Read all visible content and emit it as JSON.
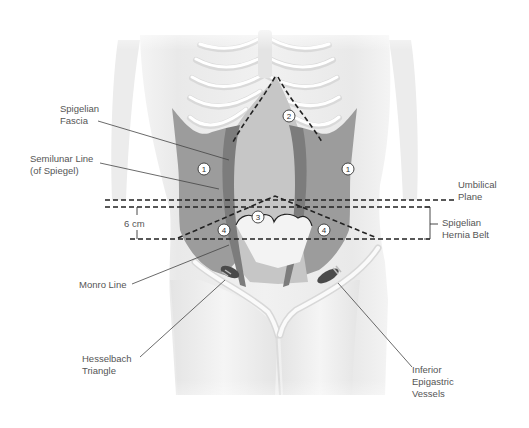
{
  "figure": {
    "labels": {
      "spigelian_fascia": [
        "Spigelian",
        "Fascia"
      ],
      "semilunar_line": [
        "Semilunar Line",
        "(of Spiegel)"
      ],
      "umbilical_plane": [
        "Umbilical",
        "Plane"
      ],
      "six_cm": "6 cm",
      "spigelian_hernia_belt": [
        "Spigelian",
        "Hernia Belt"
      ],
      "monro_line": "Monro Line",
      "hesselbach_triangle": [
        "Hesselbach",
        "Triangle"
      ],
      "inferior_epigastric_vessels": [
        "Inferior",
        "Epigastric",
        "Vessels"
      ]
    },
    "region_numbers": {
      "left_lateral": "1",
      "right_lateral": "1",
      "upper_rectus": "2",
      "umbilical": "3",
      "left_belt": "4",
      "right_belt": "4"
    },
    "colors": {
      "background": "#ffffff",
      "body": "#eeeeee",
      "body_shade": "#e2e2e2",
      "muscle": "#9a9a9a",
      "rectus": "#c4c4c4",
      "semilunar": "#7a7a7a",
      "dashed_line": "#222222",
      "text": "#555555"
    }
  }
}
